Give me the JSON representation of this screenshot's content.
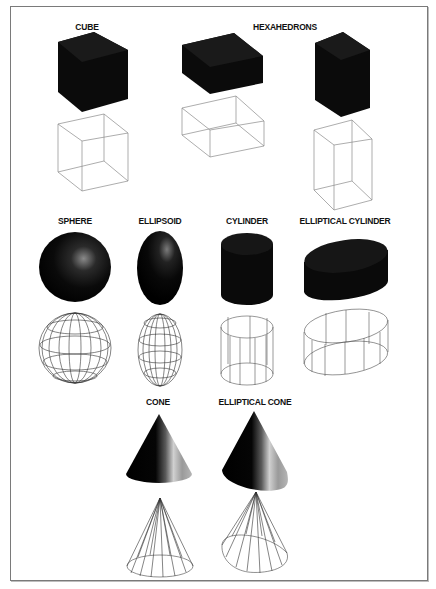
{
  "figure": {
    "labels": {
      "cube": "CUBE",
      "hexahedrons": "HEXAHEDRONS",
      "sphere": "SPHERE",
      "ellipsoid": "ELLIPSOID",
      "cylinder": "CYLINDER",
      "elliptical_cylinder": "ELLIPTICAL CYLINDER",
      "cone": "CONE",
      "elliptical_cone": "ELLIPTICAL CONE"
    },
    "rows": [
      {
        "shapes": [
          "cube",
          "hexahedron-wide",
          "hexahedron-tall"
        ]
      },
      {
        "shapes": [
          "sphere",
          "ellipsoid",
          "cylinder",
          "elliptical-cylinder"
        ]
      },
      {
        "shapes": [
          "cone",
          "elliptical-cone"
        ]
      }
    ],
    "render_modes": [
      "solid-shaded",
      "wireframe"
    ],
    "colors": {
      "solid": "#0a0a0a",
      "wire": "#555555",
      "frame": "#7a7a7a",
      "background": "#ffffff"
    }
  }
}
